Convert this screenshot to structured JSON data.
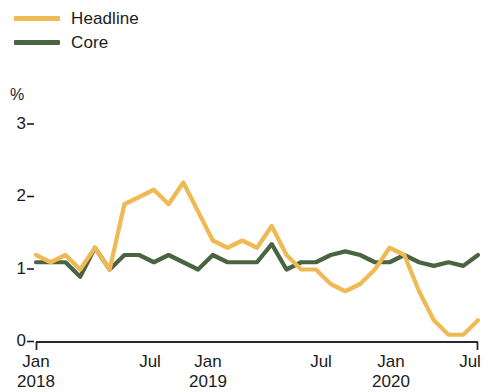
{
  "legend": {
    "items": [
      {
        "label": "Headline",
        "color": "#efb953",
        "name": "legend-headline"
      },
      {
        "label": "Core",
        "color": "#4a6341",
        "name": "legend-core"
      }
    ]
  },
  "axis": {
    "unit_label": "%",
    "y_ticks": [
      "0",
      "1",
      "2",
      "3"
    ],
    "x_ticks": [
      "Jan",
      "Jul",
      "Jan",
      "Jul",
      "Jan",
      "Jul"
    ],
    "x_years": [
      "2018",
      "",
      "2019",
      "",
      "2020",
      ""
    ]
  },
  "chart_data": {
    "type": "line",
    "title": "",
    "subtitle": "",
    "xlabel": "",
    "ylabel": "%",
    "ylim": [
      0,
      3
    ],
    "grid": false,
    "legend_position": "top-left",
    "x": [
      "Jan 2018",
      "Feb 2018",
      "Mar 2018",
      "Apr 2018",
      "May 2018",
      "Jun 2018",
      "Jul 2018",
      "Aug 2018",
      "Sep 2018",
      "Oct 2018",
      "Nov 2018",
      "Dec 2018",
      "Jan 2019",
      "Feb 2019",
      "Mar 2019",
      "Apr 2019",
      "May 2019",
      "Jun 2019",
      "Jul 2019",
      "Aug 2019",
      "Sep 2019",
      "Oct 2019",
      "Nov 2019",
      "Dec 2019",
      "Jan 2020",
      "Feb 2020",
      "Mar 2020",
      "Apr 2020",
      "May 2020",
      "Jun 2020",
      "Jul 2020"
    ],
    "series": [
      {
        "name": "Headline",
        "color": "#efb953",
        "values": [
          1.2,
          1.1,
          1.2,
          1.0,
          1.3,
          1.0,
          1.9,
          2.0,
          2.1,
          1.9,
          2.2,
          1.8,
          1.4,
          1.3,
          1.4,
          1.3,
          1.6,
          1.2,
          1.0,
          1.0,
          0.8,
          0.7,
          0.8,
          1.0,
          1.3,
          1.2,
          0.7,
          0.3,
          0.1,
          0.1,
          0.3
        ]
      },
      {
        "name": "Core",
        "color": "#4a6341",
        "values": [
          1.1,
          1.1,
          1.1,
          0.9,
          1.3,
          1.0,
          1.2,
          1.2,
          1.1,
          1.2,
          1.1,
          1.0,
          1.2,
          1.1,
          1.1,
          1.1,
          1.35,
          1.0,
          1.1,
          1.1,
          1.2,
          1.25,
          1.2,
          1.1,
          1.1,
          1.2,
          1.1,
          1.05,
          1.1,
          1.05,
          1.2
        ]
      }
    ]
  },
  "geometry": {
    "plot_left": 36,
    "plot_right": 478,
    "y_zero": 342,
    "y_unit_px": 72.5
  }
}
